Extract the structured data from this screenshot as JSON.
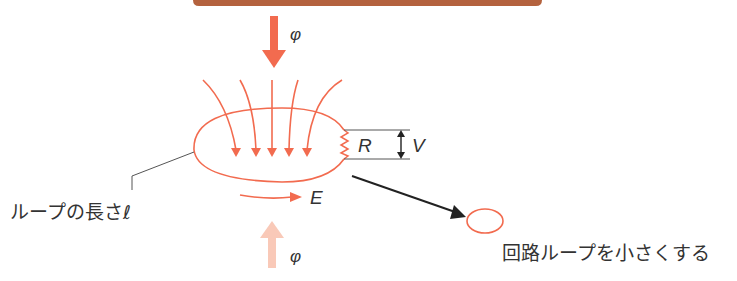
{
  "diagram": {
    "colors": {
      "accent": "#f26b4f",
      "accent_light": "#f9c9b8",
      "top_bar": "#b4623e",
      "line": "#222222",
      "leader": "#555555",
      "text": "#333333"
    },
    "labels": {
      "flux_in": "φ",
      "flux_out": "φ",
      "resistor": "R",
      "voltage": "V",
      "emf": "E",
      "loop_length": "ループの長さℓ",
      "reduce_loop": "回路ループを小さくする"
    },
    "field_lines_count": 5
  }
}
